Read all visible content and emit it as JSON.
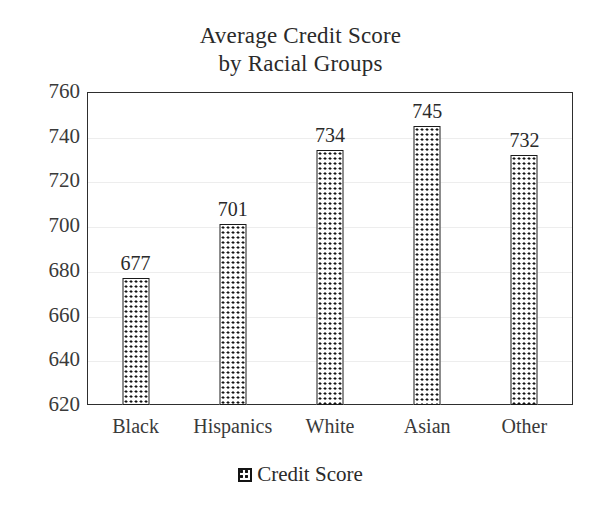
{
  "chart_data": {
    "type": "bar",
    "title": "Average Credit Score by Racial Groups",
    "title_lines": [
      "Average Credit Score",
      "by Racial Groups"
    ],
    "categories": [
      "Black",
      "Hispanics",
      "White",
      "Asian",
      "Other"
    ],
    "values": [
      677,
      701,
      734,
      745,
      732
    ],
    "value_labels": [
      "677",
      "701",
      "734",
      "745",
      "732"
    ],
    "series": [
      {
        "name": "Credit Score",
        "values": [
          677,
          701,
          734,
          745,
          732
        ]
      }
    ],
    "xlabel": "",
    "ylabel": "",
    "ylim": [
      620,
      760
    ],
    "ytick_step": 20,
    "ytick_labels": [
      "760",
      "740",
      "720",
      "700",
      "680",
      "660",
      "640",
      "620"
    ],
    "ytick_values": [
      760,
      740,
      720,
      700,
      680,
      660,
      640,
      620
    ],
    "grid": true,
    "grid_axis": "y",
    "legend": {
      "position": "bottom",
      "entries": [
        {
          "label": "Credit Score",
          "swatch": "dotted-pattern-swatch"
        }
      ]
    },
    "bar_fill": "dotted-pattern",
    "bar_border_color": "#1a1a1a",
    "background_color": "#ffffff",
    "axis_color": "#2e2e2e",
    "text_color": "#2a2a2a"
  }
}
